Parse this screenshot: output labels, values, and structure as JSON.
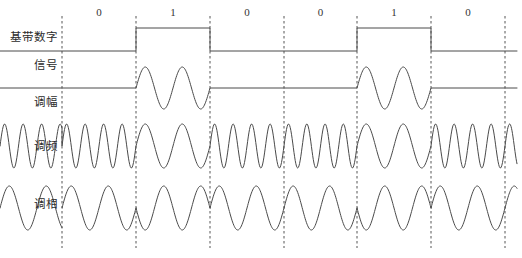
{
  "figure": {
    "background_color": "#ffffff",
    "line_color": "#4a4a4a",
    "dash_color": "#555555",
    "width": 522,
    "height": 258
  },
  "bits": {
    "sequence": [
      "0",
      "1",
      "0",
      "0",
      "1",
      "0"
    ],
    "count": 6,
    "boundaries_x": [
      62,
      136,
      210,
      284,
      357,
      431,
      505
    ]
  },
  "rows": [
    {
      "id": "baseband",
      "label_line1": "基带数字",
      "label_line2": "信号",
      "label_y1": 34,
      "label_y2": 62,
      "type": "square",
      "high_y": 28,
      "low_y": 51
    },
    {
      "id": "am",
      "label_line1": "调幅",
      "label_line2": "",
      "label_y1": 99,
      "label_y2": 0,
      "type": "ask",
      "baseline_y": 88,
      "amplitude": 21,
      "cycles_per_bit": 2
    },
    {
      "id": "fm",
      "label_line1": "调频",
      "label_line2": "",
      "label_y1": 143,
      "label_y2": 0,
      "type": "fsk",
      "baseline_y": 146,
      "amplitude": 22,
      "cycles_low_bit": 4,
      "cycles_high_bit": 2
    },
    {
      "id": "pm",
      "label_line1": "调相",
      "label_line2": "",
      "label_y1": 201,
      "label_y2": 0,
      "type": "psk",
      "baseline_y": 208,
      "amplitude": 22,
      "cycles_per_bit": 2
    }
  ],
  "chart_data": {
    "type": "line",
    "xlabel": "",
    "ylabel": "",
    "grid": false,
    "legend_position": "left",
    "categories": [
      "0",
      "1",
      "0",
      "0",
      "1",
      "0"
    ],
    "series": [
      {
        "name": "基带数字信号",
        "kind": "square",
        "values": [
          0,
          1,
          0,
          0,
          1,
          0
        ]
      },
      {
        "name": "调幅",
        "kind": "ask-amplitude-shift-keying",
        "values": [
          0,
          1,
          0,
          0,
          1,
          0
        ],
        "note": "carrier present (2 cycles) only during bit = 1"
      },
      {
        "name": "调频",
        "kind": "fsk-frequency-shift-keying",
        "values": [
          4,
          2,
          4,
          4,
          2,
          4
        ],
        "note": "cycles per bit interval: 4 for bit 0, 2 for bit 1"
      },
      {
        "name": "调相",
        "kind": "psk-phase-shift-keying",
        "values": [
          0,
          180,
          0,
          0,
          180,
          0
        ],
        "note": "phase in degrees; 2 carrier cycles per bit interval"
      }
    ],
    "xlim": [
      0,
      6
    ],
    "ylim": [
      -1,
      1
    ]
  }
}
